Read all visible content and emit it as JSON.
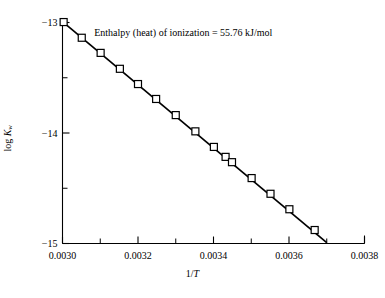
{
  "chart_data": {
    "type": "scatter",
    "title": "",
    "xlabel": "1/T",
    "ylabel": "log Kw",
    "ylabel_parts": {
      "prefix": "log ",
      "symbol": "K",
      "subscript": "w"
    },
    "xlim": [
      0.003,
      0.0038
    ],
    "ylim": [
      -15.0,
      -13.0
    ],
    "grid": false,
    "legend": "none",
    "annotations": [
      {
        "text": "Enthalpy (heat) of ionization = 55.76 kJ/mol",
        "x": 0.00332,
        "y": -13.12
      }
    ],
    "xticks": [
      0.003,
      0.0032,
      0.0034,
      0.0036,
      0.0038
    ],
    "xtick_labels": [
      "0.0030",
      "0.0032",
      "0.0034",
      "0.0036",
      "0.0038"
    ],
    "xminor_ticks": [
      0.0031,
      0.0033,
      0.0035,
      0.0037
    ],
    "yticks": [
      -13,
      -14,
      -15
    ],
    "ytick_labels": [
      "−13",
      "−14",
      "−15"
    ],
    "yminor_ticks": [
      -13.5,
      -14.5
    ],
    "marker": "open-square",
    "marker_size": 7,
    "line_color": "#000000",
    "marker_edge_color": "#000000",
    "marker_face_color": "#ffffff",
    "series": [
      {
        "name": "log Kw vs 1/T",
        "x": [
          0.003003,
          0.003051,
          0.003101,
          0.003152,
          0.0032,
          0.003248,
          0.0033,
          0.003352,
          0.003401,
          0.003432,
          0.003449,
          0.003501,
          0.003551,
          0.003601,
          0.003668
        ],
        "y": [
          -12.996,
          -13.138,
          -13.275,
          -13.419,
          -13.557,
          -13.692,
          -13.838,
          -13.985,
          -14.126,
          -14.216,
          -14.264,
          -14.408,
          -14.55,
          -14.69,
          -14.878
        ]
      }
    ],
    "fit_line": {
      "x": [
        0.003,
        0.0037
      ],
      "y": [
        -12.992,
        -14.992
      ]
    }
  },
  "figure": {
    "background_color": "#ffffff",
    "axis_color": "#000000",
    "text_color": "#000000"
  }
}
